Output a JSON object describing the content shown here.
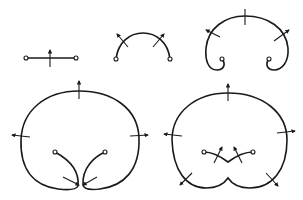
{
  "diagram": {
    "stroke_color": "#1a1a1a",
    "background": "#ffffff",
    "stages": [
      {
        "id": "stage-1",
        "shape": "straight segment",
        "endpoints": 2,
        "arrows": 1
      },
      {
        "id": "stage-2",
        "shape": "arc",
        "endpoints": 2,
        "arrows": 2
      },
      {
        "id": "stage-3",
        "shape": "horseshoe with curled ends",
        "endpoints": 2,
        "arrows": 3
      },
      {
        "id": "stage-4",
        "shape": "large loop with inward curls",
        "endpoints": 2,
        "arrows": 5
      },
      {
        "id": "stage-5",
        "shape": "large loop with notch and inner V",
        "endpoints": 2,
        "arrows": 6
      }
    ]
  }
}
